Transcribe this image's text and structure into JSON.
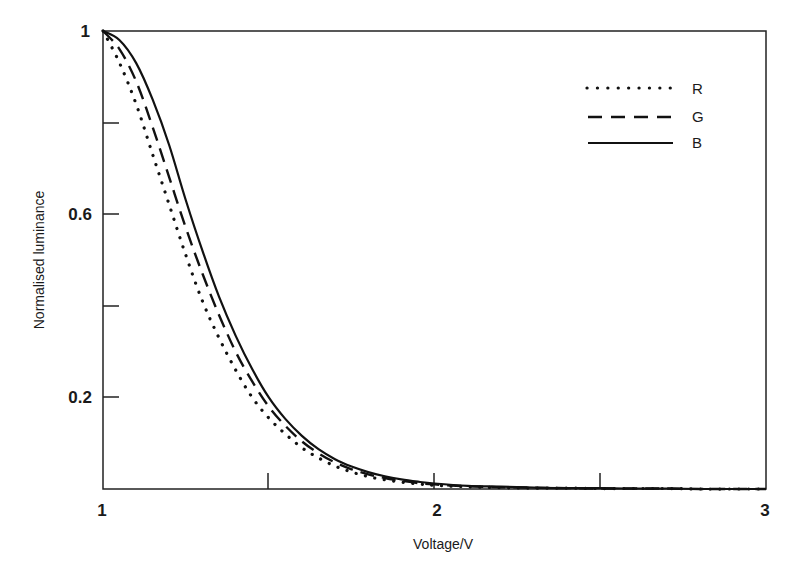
{
  "chart_data": {
    "type": "line",
    "title": "",
    "xlabel": "Voltage/V",
    "ylabel": "Normalised luminance",
    "xlim": [
      1,
      3
    ],
    "ylim": [
      0,
      1
    ],
    "x_ticks": [
      1,
      1.5,
      2,
      2.5,
      3
    ],
    "x_tick_labels": [
      "1",
      "",
      "2",
      "",
      "3"
    ],
    "y_ticks": [
      0.2,
      0.4,
      0.6,
      0.8,
      1
    ],
    "y_tick_labels": [
      "0.2",
      "",
      "0.6",
      "",
      "1"
    ],
    "grid": false,
    "legend_position": "upper right",
    "x": [
      1.0,
      1.05,
      1.1,
      1.15,
      1.2,
      1.25,
      1.3,
      1.35,
      1.4,
      1.45,
      1.5,
      1.55,
      1.6,
      1.65,
      1.7,
      1.75,
      1.8,
      1.85,
      1.9,
      1.95,
      2.0,
      2.1,
      2.2,
      2.3,
      2.4,
      2.5,
      2.6,
      2.7,
      2.8,
      2.9,
      3.0
    ],
    "series": [
      {
        "name": "R",
        "style": "dotted",
        "values": [
          1.0,
          0.93,
          0.84,
          0.73,
          0.62,
          0.51,
          0.41,
          0.33,
          0.26,
          0.2,
          0.155,
          0.12,
          0.09,
          0.068,
          0.05,
          0.037,
          0.027,
          0.02,
          0.015,
          0.011,
          0.008,
          0.005,
          0.003,
          0.002,
          0.002,
          0.001,
          0.001,
          0.001,
          0.0,
          0.0,
          0.0
        ]
      },
      {
        "name": "G",
        "style": "dashed",
        "values": [
          1.0,
          0.96,
          0.89,
          0.79,
          0.68,
          0.57,
          0.47,
          0.38,
          0.3,
          0.235,
          0.18,
          0.138,
          0.104,
          0.078,
          0.058,
          0.043,
          0.032,
          0.024,
          0.018,
          0.013,
          0.01,
          0.006,
          0.004,
          0.003,
          0.002,
          0.001,
          0.001,
          0.001,
          0.0,
          0.0,
          0.0
        ]
      },
      {
        "name": "B",
        "style": "solid",
        "values": [
          1.0,
          0.98,
          0.93,
          0.85,
          0.75,
          0.63,
          0.52,
          0.42,
          0.335,
          0.262,
          0.2,
          0.153,
          0.116,
          0.087,
          0.065,
          0.049,
          0.037,
          0.028,
          0.021,
          0.016,
          0.012,
          0.007,
          0.005,
          0.003,
          0.002,
          0.002,
          0.001,
          0.001,
          0.0,
          0.0,
          0.0
        ]
      }
    ]
  },
  "legend": {
    "items": [
      {
        "label": "R"
      },
      {
        "label": "G"
      },
      {
        "label": "B"
      }
    ]
  },
  "axes": {
    "xlabel": "Voltage/V",
    "ylabel": "Normalised luminance",
    "x_tick_labels": {
      "t1": "1",
      "t2": "2",
      "t3": "3"
    },
    "y_tick_labels": {
      "t1": "1",
      "t06": "0.6",
      "t02": "0.2"
    }
  }
}
